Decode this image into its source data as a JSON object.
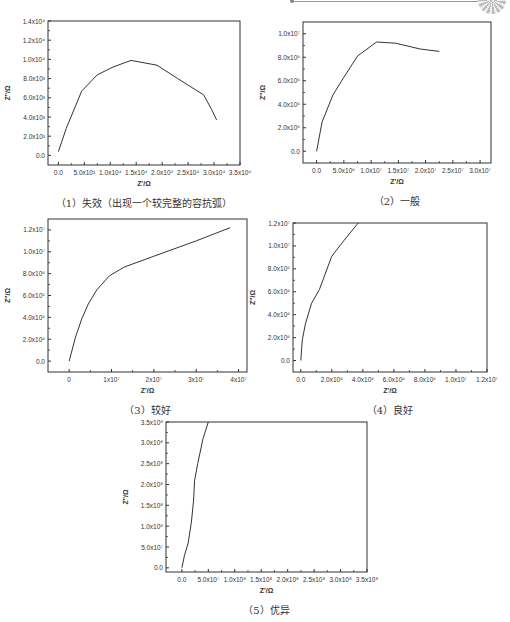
{
  "decoration": {
    "top_rule": "line-with-dot",
    "corner_badge": "circular-badge-icon"
  },
  "chart_data": [
    {
      "id": "c1",
      "type": "line",
      "caption": "（1）失效（出现一个较完整的容抗弧）",
      "xlabel": "Z'/Ω",
      "ylabel": "Z''/Ω",
      "xlim": [
        -2000,
        35000
      ],
      "ylim": [
        -1000,
        14000
      ],
      "xticks": [
        0,
        5000,
        10000,
        15000,
        20000,
        25000,
        30000,
        35000
      ],
      "xtick_labels": [
        "0.0",
        "5.0x10³",
        "1.0x10⁴",
        "1.5x10⁴",
        "2.0x10⁴",
        "2.5x10⁴",
        "3.0x10⁴",
        "3.5x10⁴"
      ],
      "yticks": [
        0,
        2000,
        4000,
        6000,
        8000,
        10000,
        12000,
        14000
      ],
      "ytick_labels": [
        "0.0",
        "2.0x10³",
        "4.0x10³",
        "6.0x10³",
        "8.0x10³",
        "1.0x10⁴",
        "1.2x10⁴",
        "1.4x10⁴"
      ],
      "x": [
        0,
        1500,
        4500,
        7500,
        10500,
        14000,
        19000,
        23000,
        28000,
        29500,
        30500
      ],
      "y": [
        400,
        2800,
        6700,
        8400,
        9200,
        9900,
        9400,
        8000,
        6300,
        4800,
        3700
      ],
      "frame": {
        "left": 48,
        "top": 21,
        "width": 192,
        "height": 144
      }
    },
    {
      "id": "c2",
      "type": "line",
      "caption": "（2）一般",
      "xlabel": "Z'/Ω",
      "ylabel": "Z''/Ω",
      "xlim": [
        -2500000,
        32000000
      ],
      "ylim": [
        -1000000,
        11000000
      ],
      "xticks": [
        0,
        5000000,
        10000000,
        15000000,
        20000000,
        25000000,
        30000000
      ],
      "xtick_labels": [
        "0.0",
        "5.0x10⁶",
        "1.0x10⁷",
        "1.5x10⁷",
        "2.0x10⁷",
        "2.5x10⁷",
        "3.0x10⁷"
      ],
      "yticks": [
        0,
        2000000,
        4000000,
        6000000,
        8000000,
        10000000
      ],
      "ytick_labels": [
        "0.0",
        "2.0x10⁶",
        "4.0x10⁶",
        "6.0x10⁶",
        "8.0x10⁶",
        "1.0x10⁷"
      ],
      "x": [
        0,
        1000000,
        3000000,
        5000000,
        7500000,
        11000000,
        14500000,
        19000000,
        22500000
      ],
      "y": [
        0,
        2500000,
        4800000,
        6300000,
        8100000,
        9300000,
        9200000,
        8700000,
        8500000
      ],
      "frame": {
        "left": 303,
        "top": 22,
        "width": 188,
        "height": 141
      }
    },
    {
      "id": "c3",
      "type": "line",
      "caption": "（3）较好",
      "xlabel": "Z'/Ω",
      "ylabel": "Z''/Ω",
      "xlim": [
        -5000000,
        42000000
      ],
      "ylim": [
        -1000000,
        13000000
      ],
      "xticks": [
        0,
        10000000,
        20000000,
        30000000,
        40000000
      ],
      "xtick_labels": [
        "0",
        "1x10⁷",
        "2x10⁷",
        "3x10⁷",
        "4x10⁷"
      ],
      "yticks": [
        0,
        2000000,
        4000000,
        6000000,
        8000000,
        10000000,
        12000000
      ],
      "ytick_labels": [
        "0.0",
        "2.0x10⁶",
        "4.0x10⁶",
        "6.0x10⁶",
        "8.0x10⁶",
        "1.0x10⁷",
        "1.2x10⁷"
      ],
      "x": [
        0,
        1500000,
        3000000,
        4500000,
        6500000,
        9500000,
        13000000,
        20000000,
        30000000,
        38000000
      ],
      "y": [
        0,
        2200000,
        3900000,
        5200000,
        6500000,
        7800000,
        8600000,
        9600000,
        11000000,
        12200000
      ],
      "frame": {
        "left": 48,
        "top": 219,
        "width": 199,
        "height": 153
      }
    },
    {
      "id": "c4",
      "type": "line",
      "caption": "（4）良好",
      "xlabel": "Z'/Ω",
      "ylabel": "Z''/Ω",
      "xlim": [
        -500000,
        12000000
      ],
      "ylim": [
        -1000000,
        12000000
      ],
      "xticks": [
        0,
        2000000,
        4000000,
        6000000,
        8000000,
        10000000,
        12000000
      ],
      "xtick_labels": [
        "0.0",
        "2.0x10⁶",
        "4.0x10⁶",
        "6.0x10⁶",
        "8.0x10⁶",
        "1.0x10⁷",
        "1.2x10⁷"
      ],
      "yticks": [
        0,
        2000000,
        4000000,
        6000000,
        8000000,
        10000000,
        12000000
      ],
      "ytick_labels": [
        "0.0",
        "2.0x10⁶",
        "4.0x10⁶",
        "6.0x10⁶",
        "8.0x10⁶",
        "1.0x10⁷",
        "1.2x10⁷"
      ],
      "x": [
        0,
        100000,
        300000,
        700000,
        1200000,
        2000000,
        2800000,
        3700000
      ],
      "y": [
        0,
        1800000,
        3200000,
        5000000,
        6200000,
        9100000,
        10500000,
        12000000
      ],
      "frame": {
        "left": 293,
        "top": 223,
        "width": 194,
        "height": 149
      }
    },
    {
      "id": "c5",
      "type": "line",
      "caption": "（5）优异",
      "xlabel": "Z'/Ω",
      "ylabel": "Z''/Ω",
      "xlim": [
        -30000000,
        350000000
      ],
      "ylim": [
        -10000000,
        350000000
      ],
      "xticks": [
        0,
        50000000,
        100000000,
        150000000,
        200000000,
        250000000,
        300000000,
        350000000
      ],
      "xtick_labels": [
        "0.0",
        "5.0x10⁷",
        "1.0x10⁸",
        "1.5x10⁸",
        "2.0x10⁸",
        "2.5x10⁸",
        "3.0x10⁸",
        "3.5x10⁸"
      ],
      "yticks": [
        0,
        50000000,
        100000000,
        150000000,
        200000000,
        250000000,
        300000000,
        350000000
      ],
      "ytick_labels": [
        "0.0",
        "5.0x10⁷",
        "1.0x10⁸",
        "1.5x10⁸",
        "2.0x10⁸",
        "2.5x10⁸",
        "3.0x10⁸",
        "3.5x10⁸"
      ],
      "x": [
        0,
        5000000,
        12000000,
        18000000,
        22000000,
        24000000,
        30000000,
        40000000,
        50000000
      ],
      "y": [
        0,
        30000000,
        60000000,
        110000000,
        160000000,
        210000000,
        250000000,
        310000000,
        350000000
      ],
      "frame": {
        "left": 166,
        "top": 422,
        "width": 201,
        "height": 150
      }
    }
  ]
}
